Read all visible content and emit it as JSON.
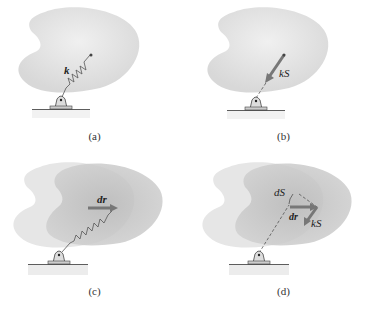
{
  "figure": {
    "panels": [
      {
        "id": "a",
        "caption": "(a)",
        "labels": {
          "spring": "k"
        }
      },
      {
        "id": "b",
        "caption": "(b)",
        "labels": {
          "force": "kS"
        }
      },
      {
        "id": "c",
        "caption": "(c)",
        "labels": {
          "displacement": "dr"
        }
      },
      {
        "id": "d",
        "caption": "(d)",
        "labels": {
          "stretch": "dS",
          "displacement": "dr",
          "force": "kS"
        }
      }
    ],
    "colors": {
      "body_fill": "#e2e2e2",
      "body_shadow": "#c8c8c8",
      "vector": "#7a7a7a",
      "line": "#555555"
    }
  }
}
